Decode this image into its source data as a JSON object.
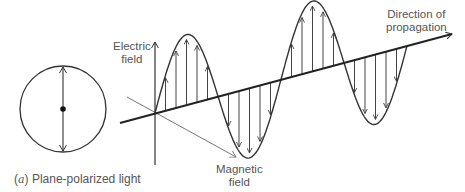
{
  "figure": {
    "caption_label": "(a)",
    "caption_letter": "a",
    "caption_text": "Plane-polarized light",
    "labels": {
      "electric_line1": "Electric",
      "electric_line2": "field",
      "magnetic_line1": "Magnetic",
      "magnetic_line2": "field",
      "direction_line1": "Direction of",
      "direction_line2": "propagation"
    },
    "colors": {
      "stroke": "#333333",
      "thin_stroke": "#777777",
      "text": "#555555"
    },
    "end_view": {
      "center": [
        63,
        109
      ],
      "radius": 43
    },
    "wave": {
      "origin": [
        155,
        113
      ],
      "axis_end": [
        452,
        34
      ],
      "wavelength_px": 126,
      "amplitude_px": 70,
      "cycles": 2
    }
  }
}
